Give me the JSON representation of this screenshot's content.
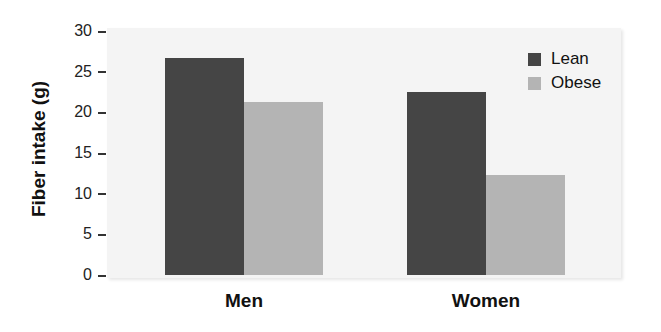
{
  "chart_data": {
    "type": "bar",
    "title": "",
    "xlabel": "",
    "ylabel": "Fiber intake (g)",
    "categories": [
      "Men",
      "Women"
    ],
    "series": [
      {
        "name": "Lean",
        "values": [
          26.7,
          22.5
        ],
        "color": "#454545"
      },
      {
        "name": "Obese",
        "values": [
          21.3,
          12.3
        ],
        "color": "#b4b4b4"
      }
    ],
    "ylim": [
      0,
      30
    ],
    "yticks": [
      0,
      5,
      10,
      15,
      20,
      25,
      30
    ],
    "grid": false,
    "legend_position": "top-right"
  },
  "axis": {
    "ylabel": "Fiber intake (g)",
    "ticks": [
      "30",
      "25",
      "20",
      "15",
      "10",
      "5",
      "0"
    ]
  },
  "categories": [
    "Men",
    "Women"
  ],
  "legend": [
    {
      "label": "Lean",
      "color": "#454545"
    },
    {
      "label": "Obese",
      "color": "#b4b4b4"
    }
  ]
}
